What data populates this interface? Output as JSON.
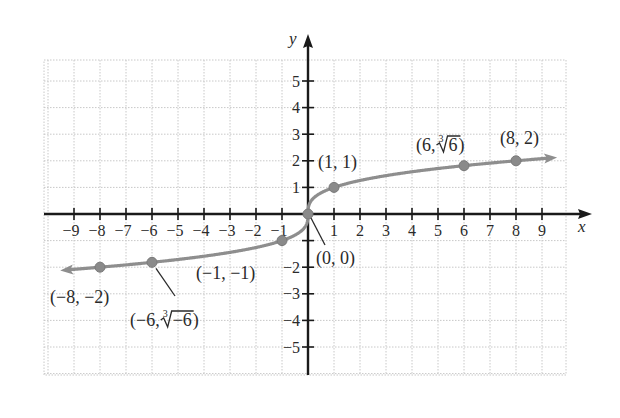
{
  "chart_data": {
    "type": "line",
    "title": "",
    "function": "f(x) = cube root of x",
    "xlabel": "x",
    "ylabel": "y",
    "xlim": [
      -10,
      10
    ],
    "ylim": [
      -6,
      6
    ],
    "grid": true,
    "x_ticks": [
      -9,
      -8,
      -7,
      -6,
      -5,
      -4,
      -3,
      -2,
      -1,
      1,
      2,
      3,
      4,
      5,
      6,
      7,
      8,
      9
    ],
    "x_tick_labels": [
      "−9",
      "−8",
      "−7",
      "−6",
      "−5",
      "−4",
      "−3",
      "−2",
      "−1",
      "1",
      "2",
      "3",
      "4",
      "5",
      "6",
      "7",
      "8",
      "9"
    ],
    "y_ticks": [
      -5,
      -4,
      -3,
      -2,
      -1,
      1,
      2,
      3,
      4,
      5
    ],
    "y_tick_labels": [
      "−5",
      "−4",
      "−3",
      "−2",
      "",
      "1",
      "2",
      "3",
      "4",
      "5"
    ],
    "series": [
      {
        "name": "y = ∛x",
        "color": "#8e8e8e",
        "x": [
          -10,
          -8,
          -6,
          -1,
          0,
          1,
          6,
          8,
          10
        ],
        "y": [
          -2.154,
          -2,
          -1.817,
          -1,
          0,
          1,
          1.817,
          2,
          2.154
        ]
      }
    ],
    "points": [
      {
        "x": -8,
        "y": -2,
        "label": "(−8, −2)"
      },
      {
        "x": -6,
        "y": -1.817,
        "label_prefix": "(−6, ",
        "radical_index": "3",
        "radicand": "−6",
        "label_suffix": ")"
      },
      {
        "x": -1,
        "y": -1,
        "label": "(−1, −1)"
      },
      {
        "x": 0,
        "y": 0,
        "label": "(0, 0)"
      },
      {
        "x": 1,
        "y": 1,
        "label": "(1, 1)"
      },
      {
        "x": 6,
        "y": 1.817,
        "label_prefix": "(6, ",
        "radical_index": "3",
        "radicand": "6",
        "label_suffix": ")"
      },
      {
        "x": 8,
        "y": 2,
        "label": "(8, 2)"
      }
    ],
    "annotations": [
      "(−8, −2)",
      "(−6, ∛−6)",
      "(−1, −1)",
      "(0, 0)",
      "(1, 1)",
      "(6, ∛6)",
      "(8, 2)"
    ],
    "legend": null
  }
}
